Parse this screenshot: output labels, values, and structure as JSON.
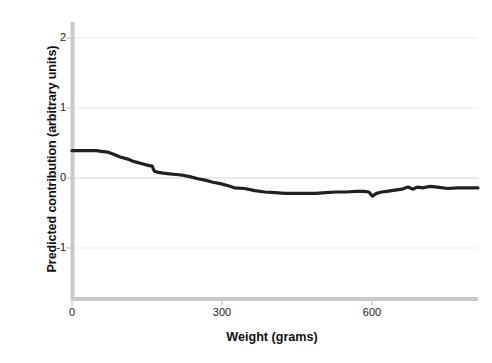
{
  "chart_data": {
    "type": "line",
    "title": "",
    "xlabel": "Weight (grams)",
    "ylabel": "Predicted contribution (arbitrary units)",
    "xlim": [
      0,
      800
    ],
    "ylim": [
      -1.45,
      2.0
    ],
    "xticks": [
      0,
      300,
      600
    ],
    "xtick_labels": [
      "0",
      "300",
      "600"
    ],
    "yticks": [
      2,
      1,
      0,
      -1
    ],
    "ytick_labels": [
      "2",
      "1",
      "0",
      "-1"
    ],
    "grid": "horizontal gridlines at y = 2, 1, 0, -1 (light gray)",
    "legend": "none",
    "series": [
      {
        "name": "Predicted contribution",
        "color": "#231f20",
        "line_width": 3.2,
        "x": [
          0,
          20,
          40,
          48,
          58,
          70,
          82,
          95,
          110,
          120,
          130,
          140,
          150,
          158,
          162,
          170,
          180,
          192,
          205,
          218,
          232,
          248,
          262,
          278,
          292,
          308,
          320,
          340,
          360,
          380,
          400,
          420,
          440,
          460,
          480,
          500,
          520,
          540,
          560,
          575,
          585,
          592,
          600,
          610,
          620,
          630,
          640,
          650,
          662,
          672,
          680,
          692,
          705,
          720,
          740,
          760,
          775,
          790,
          800
        ],
        "y": [
          0.39,
          0.39,
          0.39,
          0.39,
          0.38,
          0.37,
          0.34,
          0.3,
          0.27,
          0.24,
          0.22,
          0.2,
          0.18,
          0.17,
          0.1,
          0.08,
          0.07,
          0.06,
          0.05,
          0.04,
          0.02,
          -0.01,
          -0.03,
          -0.06,
          -0.08,
          -0.11,
          -0.14,
          -0.15,
          -0.18,
          -0.2,
          -0.21,
          -0.22,
          -0.22,
          -0.22,
          -0.22,
          -0.21,
          -0.2,
          -0.2,
          -0.19,
          -0.19,
          -0.2,
          -0.26,
          -0.22,
          -0.2,
          -0.19,
          -0.18,
          -0.17,
          -0.16,
          -0.13,
          -0.16,
          -0.13,
          -0.14,
          -0.12,
          -0.13,
          -0.15,
          -0.14,
          -0.14,
          -0.14,
          -0.14
        ]
      }
    ]
  },
  "axes": {
    "spine_color": "#c9c9c9",
    "grid_color": "#e8e8e8",
    "tick_color": "#bdbdbd"
  }
}
